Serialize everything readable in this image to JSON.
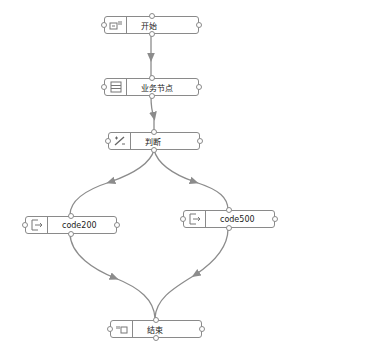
{
  "diagram": {
    "type": "flowchart",
    "colors": {
      "edge": "#8c8c8c",
      "node_border": "#8a8a8a",
      "text": "#222222",
      "background": "#ffffff"
    },
    "nodes": [
      {
        "id": "start",
        "label": "开始",
        "icon": "start-icon"
      },
      {
        "id": "business",
        "label": "业务节点",
        "icon": "form-icon"
      },
      {
        "id": "judge",
        "label": "判断",
        "icon": "percent-condition-icon"
      },
      {
        "id": "code200",
        "label": "code200",
        "icon": "exit-icon"
      },
      {
        "id": "code500",
        "label": "code500",
        "icon": "exit-icon"
      },
      {
        "id": "end",
        "label": "结束",
        "icon": "end-icon"
      }
    ],
    "edges": [
      {
        "from": "start",
        "to": "business"
      },
      {
        "from": "business",
        "to": "judge"
      },
      {
        "from": "judge",
        "to": "code200"
      },
      {
        "from": "judge",
        "to": "code500"
      },
      {
        "from": "code200",
        "to": "end"
      },
      {
        "from": "code500",
        "to": "end"
      }
    ]
  }
}
